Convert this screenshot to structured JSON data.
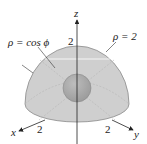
{
  "diagram": {
    "axes": {
      "x": {
        "label": "x",
        "tick": "2"
      },
      "y": {
        "label": "y",
        "tick": "2"
      },
      "z": {
        "label": "z",
        "tick": "2"
      }
    },
    "annotations": {
      "inner_sphere": "ρ = cos ϕ",
      "outer_hemisphere": "ρ = 2"
    },
    "colors": {
      "hemisphere_fill": "#c8c8c8",
      "hemisphere_edge": "#8a8a8a",
      "inner_sphere_fill": "#a9a9a9",
      "axis": "#222222",
      "background": "#ffffff"
    }
  }
}
